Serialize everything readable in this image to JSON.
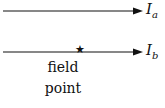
{
  "diagram": {
    "wire_a": {
      "symbol": "I",
      "subscript": "a"
    },
    "wire_b": {
      "symbol": "I",
      "subscript": "b"
    },
    "field_point_label_line1": "field",
    "field_point_label_line2": "point",
    "marker": "★",
    "colors": {
      "line": "#111111",
      "text": "#111111"
    }
  }
}
